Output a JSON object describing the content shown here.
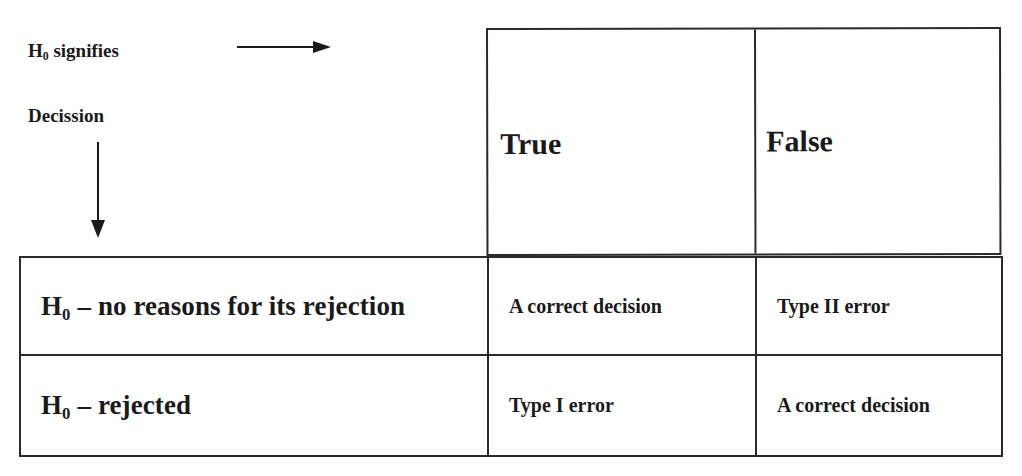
{
  "labels": {
    "h0_signifies": {
      "symbol": "H",
      "subscript": "0",
      "text": " signifies"
    },
    "decision": "Decission"
  },
  "icons": {
    "right_arrow": "arrow-right-icon",
    "down_arrow": "arrow-down-icon"
  },
  "table": {
    "columns": [
      "True",
      "False"
    ],
    "rows": [
      {
        "header": {
          "symbol": "H",
          "subscript": "0",
          "text": " – no reasons for its rejection"
        },
        "cells": [
          "A correct decision",
          "Type II error"
        ]
      },
      {
        "header": {
          "symbol": "H",
          "subscript": "0",
          "text": " – rejected"
        },
        "cells": [
          "Type I error",
          "A correct decision"
        ]
      }
    ]
  },
  "colors": {
    "line": "#2a2a2a",
    "text": "#1a1a1a",
    "background": "#ffffff"
  }
}
